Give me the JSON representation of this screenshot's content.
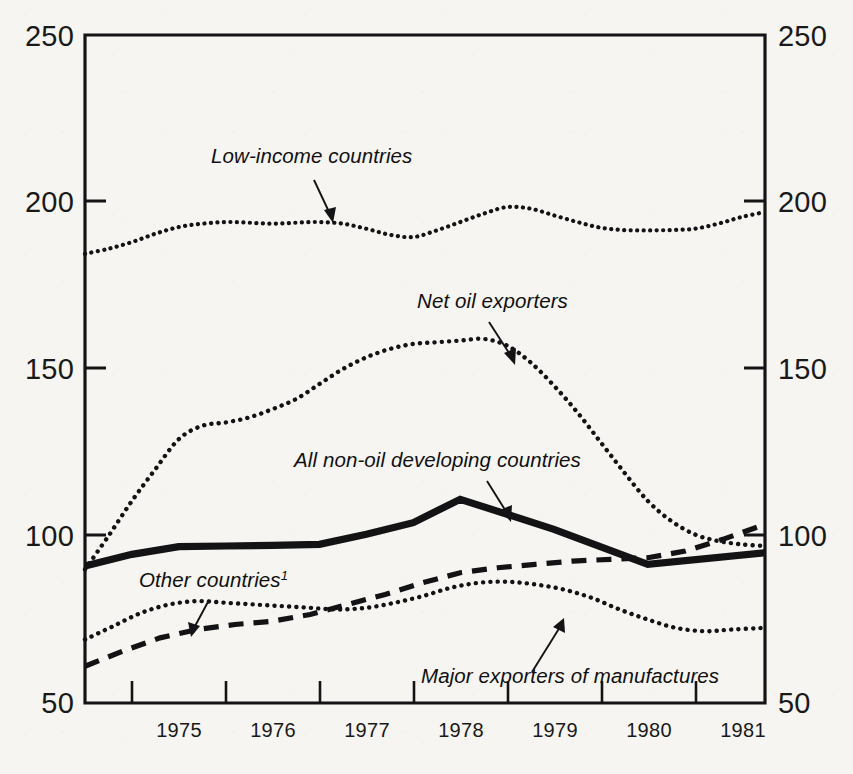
{
  "chart_data": {
    "type": "line",
    "title": "",
    "subtitle": "",
    "xlabel": "",
    "ylabel": "",
    "xlim": [
      1974.5,
      1981.75
    ],
    "ylim": [
      50,
      250
    ],
    "grid": false,
    "legend": "inline-annotations",
    "y_ticks": [
      50,
      100,
      150,
      200,
      250
    ],
    "y_ticklabels_left": [
      "250",
      "200",
      "150",
      "100",
      "50"
    ],
    "y_ticklabels_right": [
      "250",
      "200",
      "150",
      "100",
      "50"
    ],
    "x_ticklabels": [
      "1975",
      "1976",
      "1977",
      "1978",
      "1979",
      "1980",
      "1981"
    ],
    "x_tick_values": [
      1975,
      1976,
      1977,
      1978,
      1979,
      1980,
      1981
    ],
    "series": [
      {
        "name": "Low-income countries",
        "style": "dotted",
        "x": [
          1974.5,
          1974.75,
          1975.0,
          1975.25,
          1975.5,
          1975.75,
          1976.0,
          1976.25,
          1976.5,
          1976.75,
          1977.0,
          1977.25,
          1977.5,
          1977.75,
          1978.0,
          1978.25,
          1978.5,
          1978.75,
          1979.0,
          1979.25,
          1979.5,
          1979.75,
          1980.0,
          1980.25,
          1980.5,
          1980.75,
          1981.0,
          1981.25,
          1981.5,
          1981.75
        ],
        "values": [
          184.5,
          186.0,
          188.0,
          190.5,
          192.5,
          193.5,
          194.0,
          193.8,
          193.5,
          193.8,
          194.0,
          193.5,
          192.0,
          190.2,
          189.5,
          191.5,
          194.0,
          196.5,
          198.5,
          198.0,
          196.0,
          194.0,
          192.3,
          191.6,
          191.5,
          191.6,
          192.0,
          193.5,
          195.5,
          197.0
        ]
      },
      {
        "name": "Net oil exporters",
        "style": "dotted",
        "x": [
          1974.5,
          1974.75,
          1975.0,
          1975.25,
          1975.5,
          1975.75,
          1976.0,
          1976.25,
          1976.5,
          1976.75,
          1977.0,
          1977.25,
          1977.5,
          1977.75,
          1978.0,
          1978.25,
          1978.5,
          1978.75,
          1979.0,
          1979.25,
          1979.5,
          1979.75,
          1980.0,
          1980.25,
          1980.5,
          1980.75,
          1981.0,
          1981.25,
          1981.5,
          1981.75
        ],
        "values": [
          90.0,
          100.0,
          110.5,
          120.0,
          129.0,
          133.0,
          134.0,
          135.5,
          138.0,
          141.0,
          145.5,
          150.0,
          153.5,
          156.0,
          157.5,
          158.0,
          158.5,
          159.0,
          157.0,
          152.0,
          145.0,
          137.0,
          128.0,
          119.0,
          110.5,
          104.5,
          100.5,
          98.5,
          97.5,
          97.0
        ]
      },
      {
        "name": "All non-oil developing countries",
        "style": "solid-thick",
        "x": [
          1974.5,
          1975.0,
          1975.5,
          1976.0,
          1976.5,
          1977.0,
          1977.5,
          1978.0,
          1978.5,
          1979.5,
          1980.5,
          1981.75
        ],
        "values": [
          91.0,
          94.5,
          96.8,
          97.0,
          97.2,
          97.5,
          100.5,
          104.0,
          111.0,
          102.0,
          91.5,
          95.0
        ]
      },
      {
        "name": "Other countries",
        "footnote_marker": "1",
        "style": "dashed",
        "x": [
          1974.5,
          1974.9,
          1975.3,
          1975.7,
          1976.1,
          1976.5,
          1976.9,
          1977.3,
          1977.7,
          1978.1,
          1978.5,
          1978.9,
          1979.3,
          1979.7,
          1980.1,
          1980.5,
          1980.9,
          1981.3,
          1981.75
        ],
        "values": [
          61.0,
          65.5,
          69.5,
          72.0,
          73.5,
          74.5,
          76.5,
          79.5,
          82.5,
          86.0,
          89.0,
          90.5,
          91.5,
          92.5,
          93.0,
          93.5,
          95.5,
          99.0,
          103.5
        ]
      },
      {
        "name": "Major exporters of manufactures",
        "style": "dotted",
        "x": [
          1974.5,
          1974.8,
          1975.1,
          1975.4,
          1975.7,
          1976.0,
          1976.3,
          1976.6,
          1976.9,
          1977.2,
          1977.5,
          1977.8,
          1978.1,
          1978.4,
          1978.7,
          1979.0,
          1979.3,
          1979.6,
          1979.9,
          1980.2,
          1980.5,
          1980.8,
          1981.1,
          1981.4,
          1981.75
        ],
        "values": [
          69.0,
          73.0,
          77.0,
          79.5,
          80.5,
          80.0,
          79.5,
          79.0,
          78.5,
          78.0,
          78.5,
          80.0,
          82.0,
          84.5,
          86.0,
          86.3,
          85.5,
          84.0,
          81.5,
          78.0,
          75.0,
          72.5,
          71.5,
          72.0,
          72.5
        ]
      }
    ],
    "annotations": [
      {
        "label": "Low-income countries",
        "x_text": 211,
        "y_text": 163,
        "arrow_from": [
          314,
          180
        ],
        "arrow_to": [
          333,
          219
        ]
      },
      {
        "label": "Net oil exporters",
        "x_text": 417,
        "y_text": 308,
        "arrow_from": [
          489,
          322
        ],
        "arrow_to": [
          514,
          361
        ]
      },
      {
        "label": "All non-oil developing countries",
        "x_text": 294,
        "y_text": 467,
        "arrow_from": [
          487,
          481
        ],
        "arrow_to": [
          510,
          518
        ]
      },
      {
        "label": "Other countries",
        "x_text": 139,
        "y_text": 587,
        "arrow_from": [
          209,
          600
        ],
        "arrow_to": [
          192,
          634
        ]
      },
      {
        "label": "Major exporters of manufactures",
        "x_text": 421,
        "y_text": 683,
        "arrow_from": [
          532,
          672
        ],
        "arrow_to": [
          563,
          621
        ]
      }
    ]
  },
  "footnote": {
    "text": ""
  },
  "colors": {
    "ink": "#131315",
    "paper": "#f6f5f1"
  }
}
